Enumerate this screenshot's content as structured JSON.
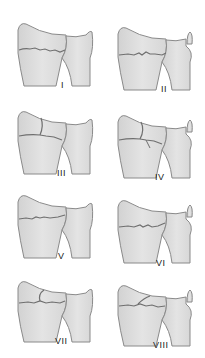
{
  "diagram": {
    "title": "",
    "colors": {
      "bone_fill": "#dcdcdc",
      "bone_fill_light": "#e6e6e6",
      "bone_outline": "#8a8a8a",
      "fracture_line": "#6f6f6f",
      "label": "#222222"
    },
    "panels": [
      {
        "id": "I",
        "label": "I",
        "row": 1,
        "col": 1,
        "fracture": "transverse radius"
      },
      {
        "id": "II",
        "label": "II",
        "row": 1,
        "col": 2,
        "fracture": "transverse radius + ulnar styloid"
      },
      {
        "id": "III",
        "label": "III",
        "row": 2,
        "col": 1,
        "fracture": "radiocarpal intra-articular"
      },
      {
        "id": "IV",
        "label": "IV",
        "row": 2,
        "col": 2,
        "fracture": "radiocarpal intra-articular + ulnar styloid"
      },
      {
        "id": "V",
        "label": "V",
        "row": 3,
        "col": 1,
        "fracture": "radioulnar joint"
      },
      {
        "id": "VI",
        "label": "VI",
        "row": 3,
        "col": 2,
        "fracture": "radioulnar joint + ulnar styloid"
      },
      {
        "id": "VII",
        "label": "VII",
        "row": 4,
        "col": 1,
        "fracture": "radiocarpal + radioulnar"
      },
      {
        "id": "VIII",
        "label": "VIII",
        "row": 4,
        "col": 2,
        "fracture": "radiocarpal + radioulnar + ulnar styloid"
      }
    ]
  }
}
